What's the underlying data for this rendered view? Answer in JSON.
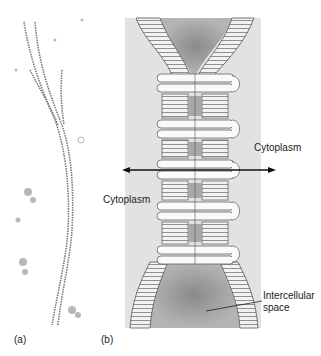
{
  "panels": {
    "a": {
      "label": "(a)",
      "description": "micrograph of membrane junction"
    },
    "b": {
      "label": "(b)",
      "description": "diagram of gap junction / desmosome between two cell membranes"
    }
  },
  "labels": {
    "cytoplasm_right": "Cytoplasm",
    "cytoplasm_left": "Cytoplasm",
    "intercellular_line1": "Intercellular",
    "intercellular_line2": "space"
  },
  "colors": {
    "panel_bg": "#e2e2e2",
    "space_fill": "#a9a9a9",
    "membrane_stripe": "#777777",
    "arrow": "#111111"
  }
}
